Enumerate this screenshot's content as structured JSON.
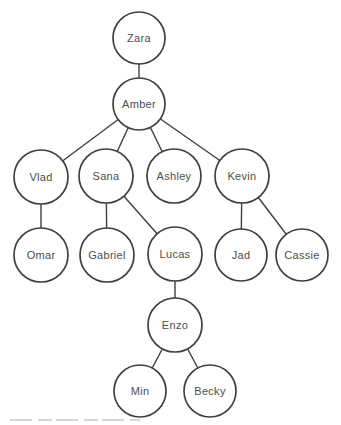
{
  "diagram": {
    "type": "tree",
    "background": "#ffffff",
    "node_fill": "#ffffff",
    "node_stroke": "#3f3f3f",
    "edge_stroke": "#3f3f3f",
    "label_color": "#4d4d4d",
    "artifact_color": "#c9c9c9",
    "nodes": [
      {
        "id": "zara",
        "label": "Zara",
        "x": 139,
        "y": 38,
        "r": 26
      },
      {
        "id": "amber",
        "label": "Amber",
        "x": 139,
        "y": 104,
        "r": 26
      },
      {
        "id": "vlad",
        "label": "Vlad",
        "x": 41,
        "y": 177,
        "r": 27
      },
      {
        "id": "sana",
        "label": "Sana",
        "x": 106,
        "y": 176,
        "r": 27
      },
      {
        "id": "ashley",
        "label": "Ashley",
        "x": 174,
        "y": 176,
        "r": 27
      },
      {
        "id": "kevin",
        "label": "Kevin",
        "x": 242,
        "y": 176,
        "r": 27
      },
      {
        "id": "omar",
        "label": "Omar",
        "x": 41,
        "y": 255,
        "r": 27
      },
      {
        "id": "gabriel",
        "label": "Gabriel",
        "x": 107,
        "y": 255,
        "r": 27
      },
      {
        "id": "lucas",
        "label": "Lucas",
        "x": 175,
        "y": 254,
        "r": 27
      },
      {
        "id": "jad",
        "label": "Jad",
        "x": 241,
        "y": 255,
        "r": 26
      },
      {
        "id": "cassie",
        "label": "Cassie",
        "x": 302,
        "y": 255,
        "r": 26
      },
      {
        "id": "enzo",
        "label": "Enzo",
        "x": 175,
        "y": 325,
        "r": 27
      },
      {
        "id": "min",
        "label": "Min",
        "x": 140,
        "y": 391,
        "r": 26
      },
      {
        "id": "becky",
        "label": "Becky",
        "x": 210,
        "y": 391,
        "r": 26
      }
    ],
    "edges": [
      {
        "from": "zara",
        "to": "amber"
      },
      {
        "from": "amber",
        "to": "vlad"
      },
      {
        "from": "amber",
        "to": "sana"
      },
      {
        "from": "amber",
        "to": "ashley"
      },
      {
        "from": "amber",
        "to": "kevin"
      },
      {
        "from": "vlad",
        "to": "omar"
      },
      {
        "from": "sana",
        "to": "gabriel"
      },
      {
        "from": "sana",
        "to": "lucas"
      },
      {
        "from": "kevin",
        "to": "jad"
      },
      {
        "from": "kevin",
        "to": "cassie"
      },
      {
        "from": "lucas",
        "to": "enzo"
      },
      {
        "from": "enzo",
        "to": "min"
      },
      {
        "from": "enzo",
        "to": "becky"
      }
    ],
    "scan_artifact_line": {
      "x1": 10,
      "y1": 420,
      "x2": 140,
      "y2": 420
    }
  }
}
